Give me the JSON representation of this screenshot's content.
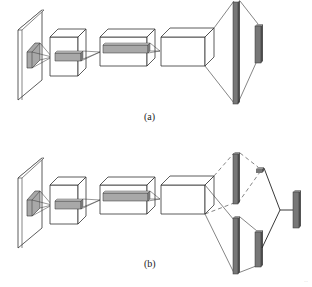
{
  "figure": {
    "panels": [
      {
        "id": "a",
        "caption": "(a)",
        "description": "CNN pipeline: input plane, three convolutional feature volumes with kernel projections, fully connected layer, output vector"
      },
      {
        "id": "b",
        "caption": "(b)",
        "description": "CNN pipeline branching into two fully connected paths (one dashed) that merge into a single output vector"
      }
    ],
    "colors": {
      "stroke": "#333333",
      "bar_fill": "#777777",
      "bar_side": "#555555",
      "kernel_fill": "#a8a8a8",
      "background": "#ffffff"
    },
    "corner_mark": "··"
  }
}
